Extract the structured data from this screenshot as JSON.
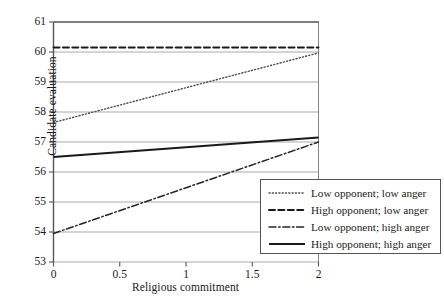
{
  "chart_data": {
    "type": "line",
    "title": "",
    "xlabel": "Religious commitment",
    "ylabel": "Candidate evaluation",
    "xlim": [
      0,
      2
    ],
    "ylim": [
      53,
      61
    ],
    "xticks": [
      "0",
      "0.5",
      "1",
      "1.5",
      "2"
    ],
    "xtick_values": [
      0,
      0.5,
      1,
      1.5,
      2
    ],
    "yticks": [
      "53",
      "54",
      "55",
      "56",
      "57",
      "58",
      "59",
      "60",
      "61"
    ],
    "ytick_values": [
      53,
      54,
      55,
      56,
      57,
      58,
      59,
      60,
      61
    ],
    "grid": "horizontal",
    "legend_position": "lower right",
    "x": [
      0,
      2
    ],
    "series": [
      {
        "name": "Low opponent; low anger",
        "style": "dotted",
        "color": "#4d4d4d",
        "values": [
          57.65,
          59.97
        ]
      },
      {
        "name": "High opponent; low anger",
        "style": "dashed",
        "color": "#1a1a1a",
        "values": [
          60.15,
          60.15
        ]
      },
      {
        "name": "Low opponent; high anger",
        "style": "dashdot",
        "color": "#262626",
        "values": [
          53.95,
          57.0
        ]
      },
      {
        "name": "High opponent; high anger",
        "style": "solid",
        "color": "#1a1a1a",
        "values": [
          56.5,
          57.15
        ]
      }
    ]
  },
  "axes": {
    "xlabel": "Religious commitment",
    "ylabel": "Candidate evaluation"
  },
  "legend": {
    "items": [
      {
        "label": "Low opponent; low anger"
      },
      {
        "label": "High opponent; low anger"
      },
      {
        "label": "Low opponent; high anger"
      },
      {
        "label": "High opponent; high anger"
      }
    ]
  }
}
